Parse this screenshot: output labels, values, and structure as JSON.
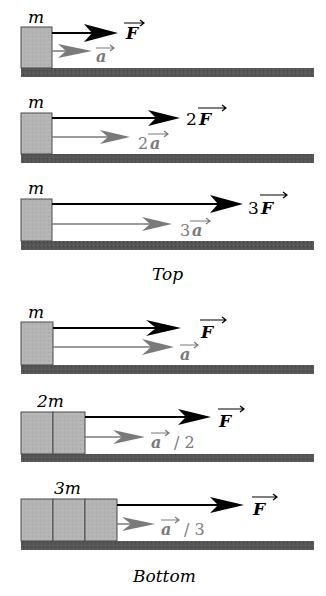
{
  "colors": {
    "block_fill": "#b4b4b4",
    "block_stroke": "#4a4a4a",
    "ground": "#555555",
    "force_arrow": "#000000",
    "accel_arrow": "#7a7a7a",
    "background": "#ffffff"
  },
  "groups": [
    {
      "caption": "Top"
    },
    {
      "caption": "Bottom"
    }
  ],
  "panels": [
    {
      "mass_label": "m",
      "blocks": 1,
      "force_coef": "",
      "force_label": "F",
      "accel_coef": "",
      "accel_label": "a",
      "accel_suffix": ""
    },
    {
      "mass_label": "m",
      "blocks": 1,
      "force_coef": "2",
      "force_label": "F",
      "accel_coef": "2",
      "accel_label": "a",
      "accel_suffix": ""
    },
    {
      "mass_label": "m",
      "blocks": 1,
      "force_coef": "3",
      "force_label": "F",
      "accel_coef": "3",
      "accel_label": "a",
      "accel_suffix": ""
    },
    {
      "mass_label": "m",
      "blocks": 1,
      "force_coef": "",
      "force_label": "F",
      "accel_coef": "",
      "accel_label": "a",
      "accel_suffix": ""
    },
    {
      "mass_label": "2m",
      "blocks": 2,
      "force_coef": "",
      "force_label": "F",
      "accel_coef": "",
      "accel_label": "a",
      "accel_suffix": "/ 2"
    },
    {
      "mass_label": "3m",
      "blocks": 3,
      "force_coef": "",
      "force_label": "F",
      "accel_coef": "",
      "accel_label": "a",
      "accel_suffix": "/ 3"
    }
  ]
}
